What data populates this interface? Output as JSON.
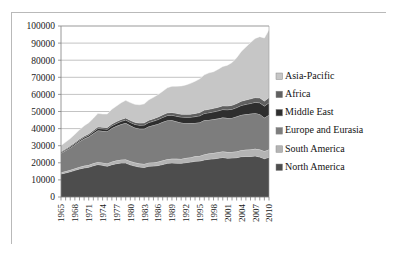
{
  "chart_data": {
    "type": "area",
    "stacked": true,
    "title": "",
    "subtitle": "",
    "xlabel": "",
    "ylabel": "",
    "ylim": [
      0,
      100000
    ],
    "ytick_step": 10000,
    "ytick_labels": [
      "0",
      "10000",
      "20000",
      "30000",
      "40000",
      "50000",
      "60000",
      "70000",
      "80000",
      "90000",
      "100000"
    ],
    "grid": true,
    "legend_position": "right",
    "x": [
      1965,
      1966,
      1967,
      1968,
      1969,
      1970,
      1971,
      1972,
      1973,
      1974,
      1975,
      1976,
      1977,
      1978,
      1979,
      1980,
      1981,
      1982,
      1983,
      1984,
      1985,
      1986,
      1987,
      1988,
      1989,
      1990,
      1991,
      1992,
      1993,
      1994,
      1995,
      1996,
      1997,
      1998,
      1999,
      2000,
      2001,
      2002,
      2003,
      2004,
      2005,
      2006,
      2007,
      2008,
      2009,
      2010
    ],
    "xtick_labels": [
      "1965",
      "1968",
      "1971",
      "1974",
      "1977",
      "1980",
      "1983",
      "1986",
      "1989",
      "1992",
      "1995",
      "1998",
      "2001",
      "2004",
      "2007",
      "2010"
    ],
    "xtick_label_rotation": -90,
    "series": [
      {
        "name": "North America",
        "color": "#4d4d4d",
        "values": [
          13500,
          14100,
          14800,
          15600,
          16400,
          17000,
          17400,
          18300,
          19000,
          18500,
          18000,
          18900,
          19500,
          19900,
          19900,
          18800,
          18100,
          17500,
          17300,
          18000,
          18100,
          18400,
          19000,
          19700,
          19900,
          19800,
          19700,
          20100,
          20400,
          20900,
          21000,
          21700,
          22100,
          22300,
          22700,
          23100,
          22700,
          22800,
          23000,
          23600,
          23700,
          23700,
          24000,
          23400,
          22400,
          23200
        ]
      },
      {
        "name": "South America",
        "color": "#b4b4b4",
        "values": [
          900,
          950,
          1000,
          1080,
          1150,
          1230,
          1300,
          1400,
          1520,
          1600,
          1650,
          1760,
          1850,
          1950,
          2030,
          2050,
          2030,
          2020,
          2000,
          2080,
          2130,
          2230,
          2320,
          2400,
          2450,
          2500,
          2560,
          2670,
          2760,
          2880,
          3000,
          3150,
          3300,
          3400,
          3440,
          3520,
          3550,
          3570,
          3620,
          3790,
          3930,
          4060,
          4230,
          4360,
          4360,
          4600
        ]
      },
      {
        "name": "Europe and Eurasia",
        "color": "#7d7d7d",
        "values": [
          11200,
          12100,
          12900,
          13900,
          14900,
          15800,
          16500,
          17400,
          18400,
          18500,
          18700,
          19600,
          20100,
          20700,
          21300,
          20900,
          20400,
          20400,
          20600,
          21200,
          21700,
          22100,
          22500,
          22700,
          22500,
          21800,
          21200,
          20400,
          19900,
          19500,
          19600,
          20000,
          19700,
          19700,
          19700,
          19800,
          19900,
          19900,
          20400,
          20600,
          20700,
          20900,
          20800,
          20700,
          19600,
          20200
        ]
      },
      {
        "name": "Middle East",
        "color": "#2e2e2e",
        "values": [
          500,
          560,
          620,
          690,
          760,
          850,
          950,
          1060,
          1180,
          1250,
          1320,
          1440,
          1560,
          1680,
          1790,
          1850,
          1930,
          2050,
          2160,
          2310,
          2450,
          2600,
          2720,
          2840,
          2990,
          3150,
          3280,
          3440,
          3600,
          3740,
          3880,
          4030,
          4200,
          4400,
          4550,
          4720,
          4880,
          5040,
          5260,
          5560,
          5840,
          6060,
          6340,
          6640,
          6800,
          7100
        ]
      },
      {
        "name": "Africa",
        "color": "#606060",
        "values": [
          500,
          540,
          580,
          630,
          680,
          740,
          800,
          860,
          920,
          950,
          980,
          1040,
          1100,
          1160,
          1210,
          1230,
          1250,
          1280,
          1310,
          1360,
          1410,
          1470,
          1520,
          1570,
          1620,
          1670,
          1710,
          1760,
          1800,
          1850,
          1900,
          1960,
          2020,
          2080,
          2130,
          2190,
          2250,
          2320,
          2400,
          2500,
          2590,
          2680,
          2770,
          2870,
          2920,
          3030
        ]
      },
      {
        "name": "Asia-Pacific",
        "color": "#c6c6c6",
        "values": [
          3500,
          3900,
          4300,
          4800,
          5400,
          6000,
          6500,
          7100,
          7900,
          7800,
          7900,
          8600,
          9100,
          9700,
          10300,
          10400,
          10500,
          10700,
          11100,
          11900,
          12500,
          13100,
          13800,
          14700,
          15300,
          15900,
          16500,
          17200,
          18000,
          18800,
          19700,
          20600,
          21300,
          21400,
          22200,
          23000,
          23800,
          25000,
          26800,
          29100,
          31000,
          32900,
          34600,
          35800,
          36900,
          39700
        ]
      }
    ],
    "totals_note": "stacked totals rise from about 30100 in 1965 to about 87800 in 2010"
  },
  "legend": {
    "items": [
      {
        "label": "Asia-Pacific",
        "color": "#c6c6c6"
      },
      {
        "label": "Africa",
        "color": "#606060"
      },
      {
        "label": "Middle East",
        "color": "#2e2e2e"
      },
      {
        "label": "Europe and Eurasia",
        "color": "#7d7d7d"
      },
      {
        "label": "South America",
        "color": "#b4b4b4"
      },
      {
        "label": "North America",
        "color": "#4d4d4d"
      }
    ]
  },
  "colors": {
    "frame_border": "#b9b9b9",
    "gridline": "#9a9a9a",
    "axis": "#7d7d7d",
    "plot_background": "#ffffff",
    "text": "#1a1a1a"
  }
}
